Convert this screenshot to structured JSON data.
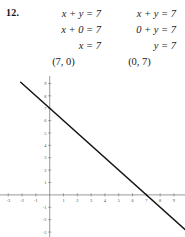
{
  "problem": {
    "number": "12.",
    "columns": [
      {
        "name": "x-intercept-solution",
        "steps": [
          "x + y = 7",
          "x + 0 = 7",
          "x = 7"
        ],
        "result": "(7, 0)"
      },
      {
        "name": "y-intercept-solution",
        "steps": [
          "x + y = 7",
          "0 + y = 7",
          "y = 7"
        ],
        "result": "(0, 7)"
      }
    ],
    "rows": [
      {
        "left": "x + y = 7",
        "right": "x + y = 7"
      },
      {
        "left": "x + 0 = 7",
        "right": "0 + y = 7"
      },
      {
        "left": "x = 7",
        "right": "y = 7"
      },
      {
        "left": "(7, 0)",
        "right": "(0, 7)"
      }
    ]
  },
  "chart_data": {
    "type": "line",
    "title": "",
    "xlabel": "",
    "ylabel": "",
    "equation": "x + y = 7",
    "xlim": [
      -3.6,
      9.8
    ],
    "ylim": [
      -3.4,
      9.6
    ],
    "x_ticks": [
      -3,
      -2,
      -1,
      1,
      2,
      3,
      4,
      5,
      6,
      7,
      8,
      9
    ],
    "y_ticks": [
      -3,
      -2,
      -1,
      1,
      2,
      3,
      4,
      5,
      6,
      7,
      8,
      9
    ],
    "x_tick_labels": [
      "-3",
      "-2",
      "-1",
      "1",
      "2",
      "3",
      "4",
      "5",
      "6",
      "7",
      "8",
      "9"
    ],
    "y_tick_labels": [
      "-3",
      "-2",
      "-1",
      "1",
      "2",
      "3",
      "4",
      "5",
      "6",
      "7",
      "8",
      "9"
    ],
    "grid": false,
    "legend": "none",
    "series": [
      {
        "name": "x + y = 7",
        "slope": -1,
        "intercept": 7,
        "points": [
          [
            -2.1,
            9.1
          ],
          [
            10.0,
            -3.0
          ]
        ],
        "x_intercept": 7,
        "y_intercept": 7
      }
    ],
    "axis_color": "#6e6e6e",
    "line_color": "#151515"
  }
}
